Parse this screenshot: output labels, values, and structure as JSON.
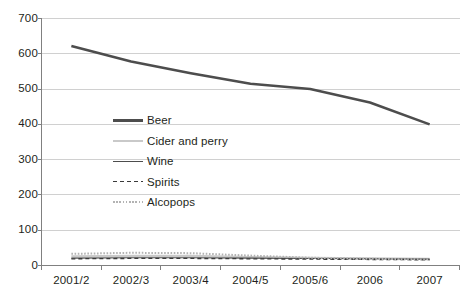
{
  "chart_data": {
    "type": "line",
    "title": "",
    "subtitle": "",
    "xlabel": "",
    "ylabel": "",
    "categories": [
      "2001/2",
      "2002/3",
      "2003/4",
      "2004/5",
      "2005/6",
      "2006",
      "2007"
    ],
    "ylim": [
      0,
      700
    ],
    "yticks": [
      0,
      100,
      200,
      300,
      400,
      500,
      600,
      700
    ],
    "ytick_labels": [
      "0",
      "100",
      "200",
      "300",
      "400",
      "500",
      "600",
      "700"
    ],
    "grid": "horizontal",
    "legend_position": "inside-left",
    "series": [
      {
        "name": "Beer",
        "values": [
          622,
          578,
          545,
          515,
          500,
          462,
          400
        ],
        "color": "#4d4d4d",
        "width": 2.6,
        "dash": "none"
      },
      {
        "name": "Cider and perry",
        "values": [
          26,
          27,
          27,
          24,
          22,
          20,
          19
        ],
        "color": "#c9c9c9",
        "width": 2.2,
        "dash": "none"
      },
      {
        "name": "Wine",
        "values": [
          21,
          22,
          22,
          21,
          20,
          19,
          18
        ],
        "color": "#4d4d4d",
        "width": 1.1,
        "dash": "none"
      },
      {
        "name": "Spirits",
        "values": [
          19,
          20,
          20,
          19,
          18,
          17,
          16
        ],
        "color": "#3a3a3a",
        "width": 1.3,
        "dash": "4,3"
      },
      {
        "name": "Alcopops",
        "values": [
          33,
          36,
          35,
          28,
          22,
          19,
          17
        ],
        "color": "#b3b3b3",
        "width": 2.0,
        "dash": "1.6,1.6"
      }
    ]
  },
  "axes": {
    "y_axis_name": "y-axis",
    "x_axis_name": "x-axis"
  }
}
